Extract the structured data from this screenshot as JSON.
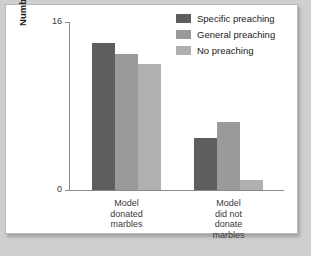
{
  "chart_data": {
    "type": "bar",
    "title": "",
    "xlabel": "",
    "ylabel": "Number of children donating\n(maximum is 16)",
    "ylim": [
      0,
      16
    ],
    "yticks": [
      "0",
      "16"
    ],
    "grid": false,
    "legend_position": "top-right",
    "categories": [
      "Model\ndonated\nmarbles",
      "Model\ndid not\ndonate\nmarbles"
    ],
    "series": [
      {
        "name": "Specific preaching",
        "color": "#5e5e5e",
        "values": [
          14,
          5
        ]
      },
      {
        "name": "General preaching",
        "color": "#9a9a9a",
        "values": [
          13,
          6.5
        ]
      },
      {
        "name": "No preaching",
        "color": "#b0b0b0",
        "values": [
          12,
          1
        ]
      }
    ]
  },
  "figure": {
    "background": "#ffffff",
    "border_color": "#b9b9b9",
    "page_background": "#cfcfcf"
  }
}
